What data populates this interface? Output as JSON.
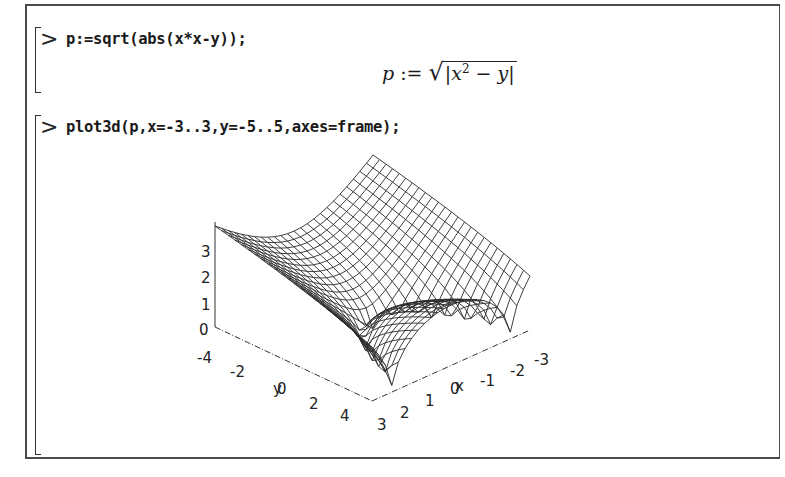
{
  "worksheet": {
    "groups": [
      {
        "prompt": ">",
        "input": "p:=sqrt(abs(x*x-y));",
        "output": {
          "lhs": "p",
          "assign": ":=",
          "radical": "√",
          "abs_open": "|",
          "base": "x",
          "exponent": "2",
          "minus": "−",
          "var": "y",
          "abs_close": "|"
        }
      },
      {
        "prompt": ">",
        "input": "plot3d(p,x=-3..3,y=-5..5,axes=frame);",
        "output": {
          "type": "plot3d-wireframe",
          "axes": "frame"
        }
      }
    ]
  },
  "chart_data": {
    "type": "surface3d",
    "title": "",
    "function": "sqrt(abs(x^2 - y))",
    "x_range": [
      -3,
      3
    ],
    "y_range": [
      -5,
      5
    ],
    "z_range": [
      0,
      3.6
    ],
    "axes": "frame",
    "style": "wireframe mesh",
    "grid_points": [
      25,
      25
    ],
    "axis_labels": {
      "x": "x",
      "y": "y",
      "z": ""
    },
    "z_ticks": [
      "0",
      "1",
      "2",
      "3"
    ],
    "y_ticks": [
      "-4",
      "-2",
      "0",
      "2",
      "4"
    ],
    "x_ticks": [
      "3",
      "2",
      "1",
      "0",
      "-1",
      "-2",
      "-3"
    ]
  },
  "colors": {
    "ink": "#1a1a1a",
    "frame": "#4a4a4a",
    "background": "#ffffff"
  }
}
